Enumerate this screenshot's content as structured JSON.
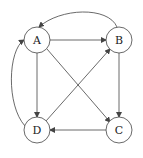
{
  "diagram": {
    "type": "directed-graph",
    "nodes": [
      {
        "id": "A",
        "label": "A",
        "x": 37,
        "y": 40
      },
      {
        "id": "B",
        "label": "B",
        "x": 119,
        "y": 40
      },
      {
        "id": "C",
        "label": "C",
        "x": 119,
        "y": 130
      },
      {
        "id": "D",
        "label": "D",
        "x": 37,
        "y": 130
      }
    ],
    "edges": [
      {
        "from": "A",
        "to": "B",
        "shape": "straight"
      },
      {
        "from": "A",
        "to": "D",
        "shape": "straight"
      },
      {
        "from": "A",
        "to": "C",
        "shape": "straight"
      },
      {
        "from": "B",
        "to": "C",
        "shape": "straight"
      },
      {
        "from": "C",
        "to": "D",
        "shape": "straight"
      },
      {
        "from": "D",
        "to": "B",
        "shape": "straight"
      },
      {
        "from": "B",
        "to": "A",
        "shape": "curved-top"
      },
      {
        "from": "D",
        "to": "A",
        "shape": "curved-left"
      }
    ],
    "colors": {
      "stroke": "#444444",
      "background": "#ffffff",
      "text": "#222222"
    }
  }
}
